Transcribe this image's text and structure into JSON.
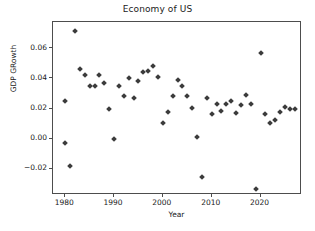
{
  "chart_data": {
    "type": "scatter",
    "title": "Economy of US",
    "xlabel": "Year",
    "ylabel": "GDP GRowth",
    "grid": false,
    "legend": null,
    "marker": "diamond",
    "marker_color": "#3b3b3b",
    "xlim": [
      1977.5,
      2028.5
    ],
    "ylim": [
      -0.0375,
      0.0775
    ],
    "xticks": [
      1980,
      1990,
      2000,
      2010,
      2020
    ],
    "xticklabels": [
      "1980",
      "1990",
      "2000",
      "2010",
      "2020"
    ],
    "yticks": [
      -0.02,
      0.0,
      0.02,
      0.04,
      0.06
    ],
    "yticklabels": [
      "−0.02",
      "0.00",
      "0.02",
      "0.04",
      "0.06"
    ],
    "x": [
      1980,
      1980,
      1981,
      1982,
      1983,
      1984,
      1985,
      1986,
      1987,
      1988,
      1989,
      1990,
      1991,
      1992,
      1993,
      1994,
      1995,
      1996,
      1997,
      1998,
      1999,
      2000,
      2001,
      2002,
      2003,
      2004,
      2005,
      2006,
      2007,
      2008,
      2009,
      2010,
      2011,
      2012,
      2013,
      2014,
      2015,
      2016,
      2017,
      2018,
      2019,
      2020,
      2021,
      2022,
      2023,
      2024,
      2025,
      2026,
      2027
    ],
    "y": [
      0.025,
      -0.003,
      -0.018,
      0.0715,
      0.046,
      0.042,
      0.0352,
      0.0352,
      0.0422,
      0.037,
      0.0195,
      -0.0005,
      0.035,
      0.028,
      0.0403,
      0.027,
      0.038,
      0.0443,
      0.0448,
      0.0482,
      0.041,
      0.0105,
      0.0174,
      0.028,
      0.039,
      0.0352,
      0.028,
      0.0205,
      0.0012,
      -0.0258,
      0.027,
      0.0165,
      0.0233,
      0.0185,
      0.0228,
      0.0252,
      0.0172,
      0.0225,
      0.029,
      0.023,
      -0.0335,
      0.057,
      0.0163,
      0.0105,
      0.0122,
      0.018,
      0.0212,
      0.0195,
      0.0195
    ]
  }
}
